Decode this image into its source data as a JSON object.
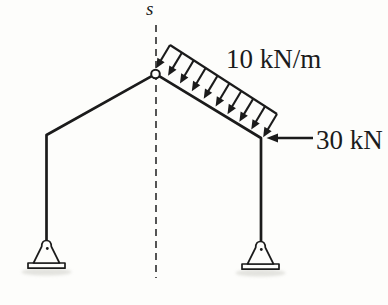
{
  "figure": {
    "type": "structural-frame-diagram",
    "section_line_label": "s",
    "loads": {
      "distributed": {
        "label": "10 kN/m",
        "value": 10,
        "unit": "kN/m",
        "arrow_count": 10,
        "applied_to": "right-sloped-member",
        "direction": "perpendicular-to-member-inward"
      },
      "point": {
        "label": "30 kN",
        "value": 30,
        "unit": "kN",
        "applied_at": "right-knee",
        "direction": "left"
      }
    },
    "apex_joint": "pin",
    "supports": {
      "left": "pin",
      "right": "pin"
    },
    "colors": {
      "background": "#fdfdfb",
      "ink": "#1b1b1b",
      "shadow": "#c9c9c2"
    }
  }
}
